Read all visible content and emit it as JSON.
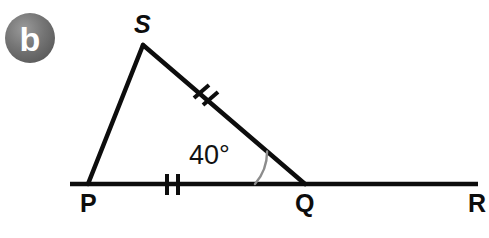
{
  "figure": {
    "part_badge": {
      "label": "b",
      "circle_color": "#6e6e6e",
      "letter_color": "#ffffff",
      "cx": 30,
      "cy": 38,
      "r": 25
    },
    "stroke_color": "#0d0d0d",
    "arc_color": "#8c8c8c",
    "background_color": "#ffffff",
    "points": {
      "S": {
        "label": "S",
        "x": 143,
        "y": 45
      },
      "P": {
        "label": "P",
        "x": 88,
        "y": 184
      },
      "Q": {
        "label": "Q",
        "x": 305,
        "y": 184
      },
      "R": {
        "label": "R",
        "x": 478,
        "y": 184
      }
    },
    "label_positions": {
      "S": {
        "x": 134,
        "y": 33
      },
      "P": {
        "x": 80,
        "y": 212
      },
      "Q": {
        "x": 295,
        "y": 212
      },
      "R": {
        "x": 468,
        "y": 212
      }
    },
    "baseline": {
      "x1": 70,
      "y1": 184,
      "x2": 478,
      "y2": 184
    },
    "segments": [
      {
        "name": "PS",
        "x1": 88,
        "y1": 184,
        "x2": 143,
        "y2": 45
      },
      {
        "name": "SQ",
        "x1": 143,
        "y1": 45,
        "x2": 305,
        "y2": 184
      }
    ],
    "angle": {
      "label": "40°",
      "value": 40,
      "unit": "degrees",
      "at_vertex": "Q",
      "label_x": 189,
      "label_y": 164,
      "arc_radius": 50
    },
    "tick_marks": [
      {
        "on_segment": "PQ",
        "count": 2,
        "cx": 172,
        "cy": 184,
        "orientation": "vertical"
      },
      {
        "on_segment": "SQ",
        "count": 2,
        "cx": 207,
        "cy": 95,
        "orientation": "perpendicular"
      }
    ]
  }
}
